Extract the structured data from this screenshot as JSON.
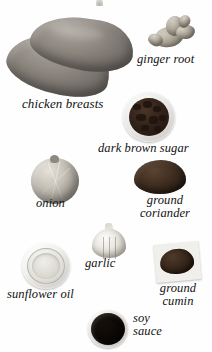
{
  "page": {
    "background_color": "#ffffff",
    "text_color": "#111111"
  },
  "ingredients": [
    {
      "id": "chicken-breasts",
      "label": "chicken breasts",
      "icon": "chicken-breasts-illustration",
      "color": "#8d8780"
    },
    {
      "id": "ginger-root",
      "label": "ginger root",
      "icon": "ginger-root-illustration",
      "color": "#a9a295"
    },
    {
      "id": "dark-brown-sugar",
      "label": "dark brown sugar",
      "icon": "bowl-of-dark-brown-sugar-illustration",
      "color": "#33231a"
    },
    {
      "id": "onion",
      "label": "onion",
      "icon": "onion-illustration",
      "color": "#c2beb3"
    },
    {
      "id": "ground-coriander",
      "label": "ground\ncoriander",
      "icon": "ground-coriander-illustration",
      "color": "#3d2c1f"
    },
    {
      "id": "garlic",
      "label": "garlic",
      "icon": "garlic-bulb-illustration",
      "color": "#e7e5df"
    },
    {
      "id": "sunflower-oil",
      "label": "sunflower oil",
      "icon": "bowl-of-sunflower-oil-illustration",
      "color": "#e2e0d9"
    },
    {
      "id": "ground-cumin",
      "label": "ground\ncumin",
      "icon": "ground-cumin-on-paper-illustration",
      "color": "#36261a"
    },
    {
      "id": "soy-sauce",
      "label": "soy\nsauce",
      "icon": "bowl-of-soy-sauce-illustration",
      "color": "#0a0705"
    }
  ]
}
